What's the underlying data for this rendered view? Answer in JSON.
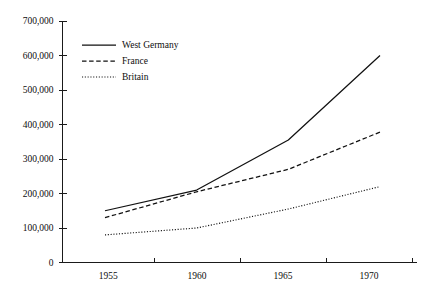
{
  "chart_data": {
    "type": "line",
    "title": "",
    "subtitle": "",
    "xlabel": "",
    "ylabel": "",
    "x": [
      1955,
      1960,
      1965,
      1970
    ],
    "categories": [
      "1955",
      "1960",
      "1965",
      "1970"
    ],
    "xlim": [
      1955,
      1970
    ],
    "ylim": [
      0,
      700000
    ],
    "grid": false,
    "legend_position": "top-left",
    "y_ticks": [
      0,
      100000,
      200000,
      300000,
      400000,
      500000,
      600000,
      700000
    ],
    "y_tick_labels": [
      "0",
      "100,000",
      "200,000",
      "300,000",
      "400,000",
      "500,000",
      "600,000",
      "700,000"
    ],
    "x_tick_labels": [
      "1955",
      "1960",
      "1965",
      "1970"
    ],
    "series": [
      {
        "name": "West Germany",
        "style": "solid",
        "color": "#111111",
        "values": [
          150000,
          210000,
          355000,
          600000
        ]
      },
      {
        "name": "France",
        "style": "dashed",
        "color": "#111111",
        "values": [
          130000,
          205000,
          270000,
          378000
        ]
      },
      {
        "name": "Britain",
        "style": "dotted",
        "color": "#111111",
        "values": [
          80000,
          100000,
          155000,
          220000
        ]
      }
    ]
  },
  "legend": {
    "items": [
      {
        "label": "West Germany",
        "style": "solid"
      },
      {
        "label": "France",
        "style": "dashed"
      },
      {
        "label": "Britain",
        "style": "dotted"
      }
    ]
  },
  "colors": {
    "background": "#ffffff",
    "axis": "#1a1a1a",
    "text": "#0d0d0d",
    "series": "#111111"
  }
}
